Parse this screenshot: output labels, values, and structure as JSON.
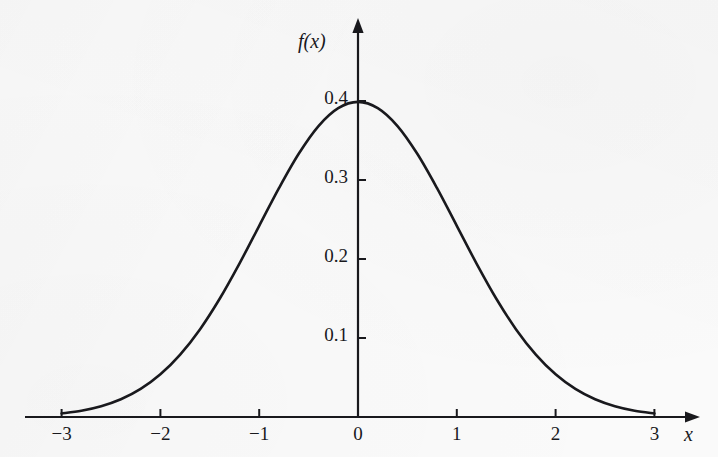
{
  "figure": {
    "background_color": "#fafafa",
    "ink_color": "#19191d",
    "width": 718,
    "height": 457
  },
  "axes": {
    "y_axis_label": "f(x)",
    "x_axis_label": "x",
    "x_ticks": [
      "-3",
      "-2",
      "-1",
      "0",
      "1",
      "2",
      "3"
    ],
    "y_ticks": [
      "0.1",
      "0.2",
      "0.3",
      "0.4"
    ]
  },
  "bleed_through_text": "",
  "chart_data": {
    "type": "line",
    "title": "",
    "subtitle": "",
    "xlabel": "x",
    "ylabel": "f(x)",
    "xlim": [
      -3,
      3
    ],
    "ylim": [
      0,
      0.43
    ],
    "grid": false,
    "legend": null,
    "xticks": [
      -3,
      -2,
      -1,
      0,
      1,
      2,
      3
    ],
    "yticks": [
      0.1,
      0.2,
      0.3,
      0.4
    ],
    "annotations": [],
    "series": [
      {
        "name": "standard normal pdf",
        "color": "#19191d",
        "line_width": 2.6,
        "x": [
          -3.0,
          -2.8,
          -2.6,
          -2.4,
          -2.2,
          -2.0,
          -1.8,
          -1.6,
          -1.4,
          -1.2,
          -1.0,
          -0.8,
          -0.6,
          -0.4,
          -0.2,
          0.0,
          0.2,
          0.4,
          0.6,
          0.8,
          1.0,
          1.2,
          1.4,
          1.6,
          1.8,
          2.0,
          2.2,
          2.4,
          2.6,
          2.8,
          3.0
        ],
        "y": [
          0.0044,
          0.0079,
          0.0136,
          0.0224,
          0.0355,
          0.054,
          0.079,
          0.1109,
          0.1497,
          0.1942,
          0.242,
          0.2897,
          0.3332,
          0.3683,
          0.391,
          0.3989,
          0.391,
          0.3683,
          0.3332,
          0.2897,
          0.242,
          0.1942,
          0.1497,
          0.1109,
          0.079,
          0.054,
          0.0355,
          0.0224,
          0.0136,
          0.0079,
          0.0044
        ]
      }
    ]
  }
}
